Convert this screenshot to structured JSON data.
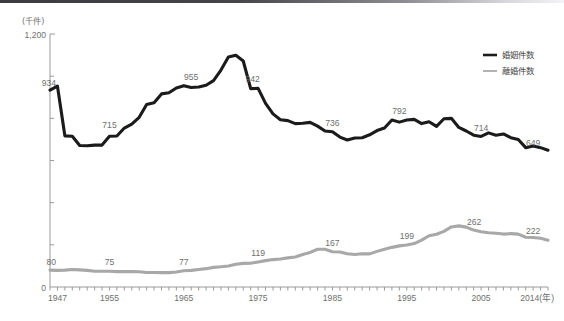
{
  "figure": {
    "unit_label": "(千件)",
    "x_unit_suffix": "(年)",
    "y_top_label": "1,200",
    "y_zero_label": "0"
  },
  "legend": {
    "position": "top-right",
    "items": [
      {
        "name": "marriages",
        "label": "婚姻件数",
        "color": "#1b1b1b"
      },
      {
        "name": "divorces",
        "label": "離婚件数",
        "color": "#a8a8a8"
      }
    ]
  },
  "chart_data": {
    "type": "line",
    "title": "",
    "xlabel": "年",
    "ylabel": "千件",
    "xlim": [
      1947,
      2014
    ],
    "ylim": [
      0,
      1200
    ],
    "grid": false,
    "tick_labels_x": [
      "1947",
      "1955",
      "1965",
      "1975",
      "1985",
      "1995",
      "2005",
      "2014(年)"
    ],
    "tick_values_x": [
      1947,
      1955,
      1965,
      1975,
      1985,
      1995,
      2005,
      2014
    ],
    "tick_labels_y": [
      "0",
      "1,200"
    ],
    "tick_values_y": [
      0,
      1200
    ],
    "x": [
      1947,
      1948,
      1949,
      1950,
      1951,
      1952,
      1953,
      1954,
      1955,
      1956,
      1957,
      1958,
      1959,
      1960,
      1961,
      1962,
      1963,
      1964,
      1965,
      1966,
      1967,
      1968,
      1969,
      1970,
      1971,
      1972,
      1973,
      1974,
      1975,
      1976,
      1977,
      1978,
      1979,
      1980,
      1981,
      1982,
      1983,
      1984,
      1985,
      1986,
      1987,
      1988,
      1989,
      1990,
      1991,
      1992,
      1993,
      1994,
      1995,
      1996,
      1997,
      1998,
      1999,
      2000,
      2001,
      2002,
      2003,
      2004,
      2005,
      2006,
      2007,
      2008,
      2009,
      2010,
      2011,
      2012,
      2013,
      2014
    ],
    "series": [
      {
        "name": "婚姻件数",
        "label": "marriages",
        "color": "#1b1b1b",
        "values": [
          934,
          953,
          717,
          715,
          671,
          670,
          673,
          673,
          715,
          716,
          754,
          773,
          805,
          866,
          874,
          916,
          921,
          944,
          955,
          946,
          949,
          957,
          979,
          1029,
          1091,
          1099,
          1072,
          941,
          942,
          871,
          821,
          793,
          789,
          775,
          777,
          781,
          763,
          740,
          736,
          711,
          697,
          707,
          708,
          722,
          742,
          754,
          792,
          782,
          792,
          795,
          775,
          784,
          762,
          798,
          800,
          757,
          740,
          720,
          714,
          731,
          720,
          726,
          708,
          700,
          661,
          669,
          661,
          649
        ]
      },
      {
        "name": "離婚件数",
        "label": "divorces",
        "color": "#a8a8a8",
        "values": [
          80,
          79,
          80,
          83,
          81,
          79,
          75,
          75,
          75,
          73,
          73,
          73,
          72,
          69,
          69,
          68,
          68,
          71,
          77,
          79,
          83,
          87,
          93,
          96,
          100,
          108,
          112,
          113,
          119,
          125,
          130,
          133,
          138,
          142,
          154,
          164,
          179,
          179,
          167,
          166,
          158,
          154,
          158,
          157,
          169,
          179,
          188,
          195,
          199,
          206,
          222,
          243,
          250,
          264,
          285,
          290,
          284,
          270,
          262,
          257,
          255,
          251,
          253,
          251,
          236,
          235,
          231,
          222
        ]
      }
    ],
    "annotations": [
      {
        "series": "婚姻件数",
        "year": 1947,
        "value": 934,
        "text": "934"
      },
      {
        "series": "婚姻件数",
        "year": 1955,
        "value": 715,
        "text": "715"
      },
      {
        "series": "婚姻件数",
        "year": 1966,
        "value": 955,
        "text": "955"
      },
      {
        "series": "婚姻件数",
        "year": 1974,
        "value": 942,
        "text": "942"
      },
      {
        "series": "婚姻件数",
        "year": 1985,
        "value": 736,
        "text": "736"
      },
      {
        "series": "婚姻件数",
        "year": 1994,
        "value": 792,
        "text": "792"
      },
      {
        "series": "婚姻件数",
        "year": 2005,
        "value": 714,
        "text": "714"
      },
      {
        "series": "婚姻件数",
        "year": 2014,
        "value": 649,
        "text": "649"
      },
      {
        "series": "離婚件数",
        "year": 1947,
        "value": 80,
        "text": "80"
      },
      {
        "series": "離婚件数",
        "year": 1955,
        "value": 75,
        "text": "75"
      },
      {
        "series": "離婚件数",
        "year": 1965,
        "value": 77,
        "text": "77"
      },
      {
        "series": "離婚件数",
        "year": 1975,
        "value": 119,
        "text": "119"
      },
      {
        "series": "離婚件数",
        "year": 1985,
        "value": 167,
        "text": "167"
      },
      {
        "series": "離婚件数",
        "year": 1995,
        "value": 199,
        "text": "199"
      },
      {
        "series": "離婚件数",
        "year": 2003,
        "value": 262,
        "text": "262"
      },
      {
        "series": "離婚件数",
        "year": 2014,
        "value": 222,
        "text": "222"
      }
    ]
  }
}
